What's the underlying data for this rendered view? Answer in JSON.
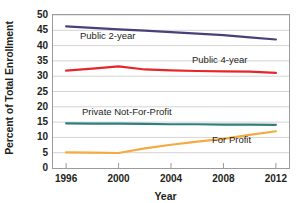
{
  "chart_data": {
    "type": "line",
    "title": "",
    "xlabel": "Year",
    "ylabel": "Percent of Total Enrollment",
    "x": [
      1996,
      1998,
      2000,
      2002,
      2004,
      2006,
      2008,
      2010,
      2012
    ],
    "xlim": [
      1995,
      2013
    ],
    "ylim": [
      0,
      50
    ],
    "xticks": [
      "1996",
      "2000",
      "2004",
      "2008",
      "2012"
    ],
    "xtick_values": [
      1996,
      2000,
      2004,
      2008,
      2012
    ],
    "yticks": [
      "0",
      "5",
      "10",
      "15",
      "20",
      "25",
      "30",
      "35",
      "40",
      "45",
      "50"
    ],
    "ytick_values": [
      0,
      5,
      10,
      15,
      20,
      25,
      30,
      35,
      40,
      45,
      50
    ],
    "grid": "horizontal",
    "legend_position": "inline-labels",
    "series": [
      {
        "name": "Public 2-year",
        "color": "#4b3f7a",
        "values": [
          46.3,
          45.8,
          45.3,
          44.9,
          44.4,
          43.9,
          43.4,
          42.7,
          42.0
        ]
      },
      {
        "name": "Public 4-year",
        "color": "#e8262a",
        "values": [
          31.8,
          32.5,
          33.2,
          32.2,
          31.9,
          31.7,
          31.6,
          31.5,
          31.1
        ]
      },
      {
        "name": "Private Not-For-Profit",
        "color": "#2e7f7f",
        "values": [
          14.6,
          14.5,
          14.5,
          14.4,
          14.3,
          14.3,
          14.2,
          14.2,
          14.1
        ]
      },
      {
        "name": "For Profit",
        "color": "#f5a93f",
        "values": [
          5.1,
          5.0,
          4.9,
          6.4,
          7.6,
          8.6,
          9.5,
          10.8,
          12.0
        ]
      }
    ]
  },
  "axis": {
    "y_title": "Percent of Total Enrollment",
    "x_title": "Year"
  },
  "colors": {
    "public_2_year": "#4b3f7a",
    "public_4_year": "#e8262a",
    "private_not_for_profit": "#2e7f7f",
    "for_profit": "#f5a93f",
    "axis": "#9b9b9b",
    "grid": "#d4d4d4",
    "text": "#231f20",
    "background": "#ffffff"
  }
}
